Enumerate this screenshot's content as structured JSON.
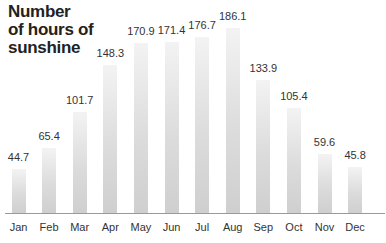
{
  "chart_data": {
    "type": "bar",
    "title": "Number of hours of sunshine",
    "title_lines": [
      "Number",
      "of hours of",
      "sunshine"
    ],
    "xlabel": "",
    "ylabel": "",
    "categories": [
      "Jan",
      "Feb",
      "Mar",
      "Apr",
      "May",
      "Jun",
      "Jul",
      "Aug",
      "Sep",
      "Oct",
      "Nov",
      "Dec"
    ],
    "values": [
      44.7,
      65.4,
      101.7,
      148.3,
      170.9,
      171.4,
      176.7,
      186.1,
      133.9,
      105.4,
      59.6,
      45.8
    ],
    "value_labels": [
      "44.7",
      "65.4",
      "101.7",
      "148.3",
      "170.9",
      "171.4",
      "176.7",
      "186.1",
      "133.9",
      "105.4",
      "59.6",
      "45.8"
    ],
    "ylim": [
      0,
      190
    ],
    "grid": false,
    "legend": null,
    "bar_color": "#d8d8d8"
  }
}
